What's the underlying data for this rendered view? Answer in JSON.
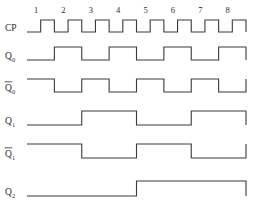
{
  "figure": {
    "caption": "",
    "line_color": "#3a3a3a",
    "text_color": "#2b2b2b",
    "background": "#ffffff"
  },
  "axis": {
    "tick_labels": [
      "1",
      "2",
      "3",
      "4",
      "5",
      "6",
      "7",
      "8"
    ],
    "cycles": 8,
    "x_start": 27,
    "x_end": 246,
    "unit_width": 27.4
  },
  "rows": [
    {
      "name": "CP",
      "label": "CP",
      "subscript": "",
      "overbar": false,
      "baseline_y": 32,
      "amplitude": 12,
      "type": "clock",
      "description": "Clock pulse train, 8 positive pulses",
      "levels": [
        0,
        1,
        0,
        1,
        0,
        1,
        0,
        1,
        0,
        1,
        0,
        1,
        0,
        1,
        0,
        1,
        0
      ]
    },
    {
      "name": "Q0",
      "label": "Q",
      "subscript": "0",
      "overbar": false,
      "baseline_y": 60,
      "amplitude": 13,
      "type": "divide-by-2",
      "description": "Toggles on each clock falling edge, starts low",
      "levels": [
        0,
        0,
        1,
        1,
        0,
        0,
        1,
        1,
        0,
        0,
        1,
        1,
        0,
        0,
        1,
        1,
        0
      ]
    },
    {
      "name": "Q0bar",
      "label": "Q",
      "subscript": "0",
      "overbar": true,
      "baseline_y": 92,
      "amplitude": 13,
      "type": "divide-by-2-inverted",
      "description": "Complement of Q0, starts high",
      "levels": [
        1,
        1,
        0,
        0,
        1,
        1,
        0,
        0,
        1,
        1,
        0,
        0,
        1,
        1,
        0,
        0,
        1
      ]
    },
    {
      "name": "Q1",
      "label": "Q",
      "subscript": "1",
      "overbar": false,
      "baseline_y": 125,
      "amplitude": 14,
      "type": "divide-by-4",
      "description": "Toggles every two clocks, starts low",
      "levels": [
        0,
        0,
        0,
        0,
        1,
        1,
        1,
        1,
        0,
        0,
        0,
        0,
        1,
        1,
        1,
        1,
        0
      ]
    },
    {
      "name": "Q1bar",
      "label": "Q",
      "subscript": "1",
      "overbar": true,
      "baseline_y": 158,
      "amplitude": 14,
      "type": "divide-by-4-inverted",
      "description": "Complement of Q1, starts high",
      "levels": [
        1,
        1,
        1,
        1,
        0,
        0,
        0,
        0,
        1,
        1,
        1,
        1,
        0,
        0,
        0,
        0,
        1
      ]
    },
    {
      "name": "Q2",
      "label": "Q",
      "subscript": "2",
      "overbar": false,
      "baseline_y": 196,
      "amplitude": 15,
      "type": "divide-by-8",
      "description": "Goes high after clock 4, low after clock 8",
      "levels": [
        0,
        0,
        0,
        0,
        0,
        0,
        0,
        0,
        1,
        1,
        1,
        1,
        1,
        1,
        1,
        1,
        0
      ]
    }
  ]
}
